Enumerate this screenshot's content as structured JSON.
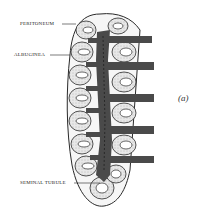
{
  "figure": {
    "panel_label": "(a)",
    "labels": [
      {
        "id": "peritoneum",
        "text": "PERITONEUM"
      },
      {
        "id": "albuginea",
        "text": "ALBUGINEA"
      },
      {
        "id": "seminal_tubule",
        "text": "SEMINAL TUBULE"
      }
    ],
    "colors": {
      "outline": "#2a2a2a",
      "core": "#4a4a4a",
      "tubule_fill": "#e4e4e4",
      "background": "#ffffff"
    }
  }
}
